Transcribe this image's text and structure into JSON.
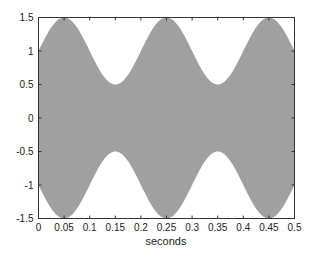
{
  "chart_data": {
    "type": "area",
    "title": "",
    "xlabel": "seconds",
    "ylabel": "",
    "xlim": [
      0,
      0.5
    ],
    "ylim": [
      -1.5,
      1.5
    ],
    "grid": false,
    "legend": null,
    "fill_color": "#a0a0a0",
    "x_ticks": [
      0,
      0.05,
      0.1,
      0.15,
      0.2,
      0.25,
      0.3,
      0.35,
      0.4,
      0.45,
      0.5
    ],
    "x_tick_labels": [
      "0",
      "0.05",
      "0.1",
      "0.15",
      "0.2",
      "0.25",
      "0.3",
      "0.35",
      "0.4",
      "0.45",
      "0.5"
    ],
    "y_ticks": [
      -1.5,
      -1,
      -0.5,
      0,
      0.5,
      1,
      1.5
    ],
    "y_tick_labels": [
      "-1.5",
      "-1",
      "-0.5",
      "0",
      "0.5",
      "1",
      "1.5"
    ],
    "series": [
      {
        "name": "upper envelope",
        "x": [
          0,
          0.05,
          0.1,
          0.15,
          0.2,
          0.25,
          0.3,
          0.35,
          0.4,
          0.45,
          0.5
        ],
        "values": [
          1.0,
          1.5,
          1.0,
          0.5,
          1.0,
          1.5,
          1.0,
          0.5,
          1.0,
          1.5,
          1.0
        ]
      },
      {
        "name": "lower envelope",
        "x": [
          0,
          0.05,
          0.1,
          0.15,
          0.2,
          0.25,
          0.3,
          0.35,
          0.4,
          0.45,
          0.5
        ],
        "values": [
          -1.0,
          -1.5,
          -1.0,
          -0.5,
          -1.0,
          -1.5,
          -1.0,
          -0.5,
          -1.0,
          -1.5,
          -1.0
        ]
      }
    ],
    "envelope_model": {
      "offset": 1.0,
      "amplitude": 0.5,
      "frequency_hz": 5
    }
  }
}
